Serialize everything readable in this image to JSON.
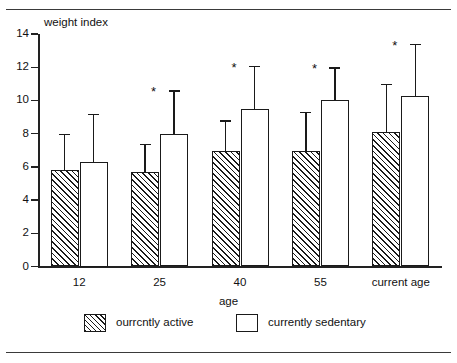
{
  "figure": {
    "top_rule": true,
    "bottom_rule": true
  },
  "chart_data": {
    "type": "bar",
    "title": "",
    "ylabel": "weight index",
    "xlabel": "age",
    "categories": [
      "12",
      "25",
      "40",
      "55",
      "current age"
    ],
    "ylim": [
      0,
      14
    ],
    "yticks": [
      0,
      2,
      4,
      6,
      8,
      10,
      12,
      14
    ],
    "ytick_labels": [
      "0",
      "2",
      "4",
      "6",
      "8",
      "10",
      "12",
      "14"
    ],
    "grid": false,
    "legend_position": "bottom",
    "error_bar_type": "upper-only",
    "significance_marker": "*",
    "series": [
      {
        "name": "ourrcntly active",
        "pattern": "diagonal-hatch",
        "values": [
          5.8,
          5.7,
          6.95,
          6.95,
          8.1
        ],
        "error_upper": [
          8.0,
          7.4,
          8.8,
          9.3,
          11.0
        ],
        "significant": [
          false,
          false,
          false,
          false,
          false
        ]
      },
      {
        "name": "currently sedentary",
        "pattern": "solid-white",
        "values": [
          6.3,
          8.0,
          9.5,
          10.05,
          10.25
        ],
        "error_upper": [
          9.2,
          10.6,
          12.1,
          12.0,
          13.4
        ],
        "significant": [
          false,
          true,
          true,
          true,
          true
        ]
      }
    ]
  },
  "legend": {
    "items": [
      {
        "label": "ourrcntly active",
        "swatch": "diagonal-hatch"
      },
      {
        "label": "currently sedentary",
        "swatch": "solid-white"
      }
    ]
  },
  "colors": {
    "ink": "#1a1a1a",
    "rule": "#3a3a3a",
    "background": "#ffffff"
  }
}
